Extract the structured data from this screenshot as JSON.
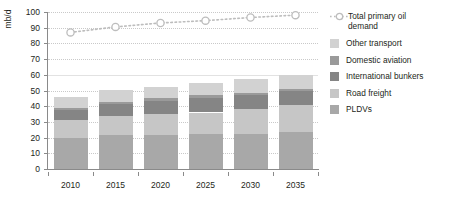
{
  "chart_data": {
    "type": "bar",
    "title": "",
    "subtitle": "",
    "xlabel": "",
    "ylabel": "mb/d",
    "categories": [
      "2010",
      "2015",
      "2020",
      "2025",
      "2030",
      "2035"
    ],
    "ylim": [
      0,
      100
    ],
    "yticks": [
      0,
      10,
      20,
      30,
      40,
      50,
      60,
      70,
      80,
      90,
      100
    ],
    "grid": true,
    "legend_position": "right",
    "stacked": true,
    "series": [
      {
        "name": "PLDVs",
        "type": "bar",
        "color": "#a8a8a8",
        "values": [
          20.0,
          21.5,
          21.5,
          22.0,
          22.5,
          23.5
        ]
      },
      {
        "name": "Road freight",
        "type": "bar",
        "color": "#c6c6c6",
        "values": [
          11.0,
          12.5,
          13.5,
          14.0,
          15.5,
          17.0
        ]
      },
      {
        "name": "International bunkers",
        "type": "bar",
        "color": "#858585",
        "values": [
          6.5,
          7.5,
          8.5,
          9.5,
          9.0,
          9.0
        ]
      },
      {
        "name": "Domestic aviation",
        "type": "bar",
        "color": "#9a9a9a",
        "values": [
          1.5,
          1.5,
          1.5,
          1.5,
          1.5,
          1.5
        ]
      },
      {
        "name": "Other transport",
        "type": "bar",
        "color": "#d2d2d2",
        "values": [
          7.0,
          7.5,
          7.5,
          8.0,
          9.0,
          9.0
        ]
      },
      {
        "name": "Total primary oil demand",
        "type": "line",
        "color": "#bdbdbd",
        "marker": "circle-open",
        "linestyle": "dotted",
        "values": [
          87.0,
          90.5,
          93.0,
          94.5,
          96.5,
          98.0
        ]
      }
    ],
    "stack_totals": [
      46.0,
      50.5,
      52.5,
      55.0,
      57.5,
      60.0
    ]
  },
  "legend": {
    "items": [
      {
        "label": "Total primary oil\ndemand",
        "type": "line-marker",
        "color": "#bdbdbd"
      },
      {
        "label": "Other transport",
        "type": "swatch",
        "color": "#d2d2d2"
      },
      {
        "label": "Domestic aviation",
        "type": "swatch",
        "color": "#9a9a9a"
      },
      {
        "label": "International bunkers",
        "type": "swatch",
        "color": "#858585"
      },
      {
        "label": "Road freight",
        "type": "swatch",
        "color": "#c6c6c6"
      },
      {
        "label": "PLDVs",
        "type": "swatch",
        "color": "#a8a8a8"
      }
    ]
  },
  "axis": {
    "y_title": "mb/d"
  }
}
